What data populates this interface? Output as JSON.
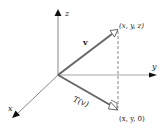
{
  "diagram": {
    "axes": {
      "x_label": "x",
      "y_label": "y",
      "z_label": "z"
    },
    "vectors": [
      {
        "id": "v",
        "label": "v",
        "endpoint_label": "(x, y, z)"
      },
      {
        "id": "Tv",
        "label": "T(v)",
        "endpoint_label": "(x, y, 0)"
      }
    ],
    "colors": {
      "axis": "#888888",
      "vector": "#666666",
      "text": "#222222",
      "background": "#ffffff"
    }
  }
}
